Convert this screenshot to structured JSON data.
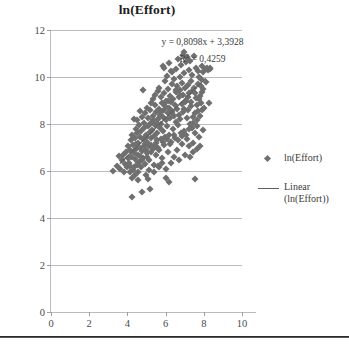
{
  "chart_data": {
    "type": "scatter",
    "title": "ln(Effort)",
    "xlabel": "",
    "ylabel": "",
    "xlim": [
      0,
      10
    ],
    "ylim": [
      0,
      12
    ],
    "xticks": [
      0,
      2,
      4,
      6,
      8,
      10
    ],
    "yticks": [
      0,
      2,
      4,
      6,
      8,
      10,
      12
    ],
    "xtick_labels": [
      "0",
      "2",
      "4",
      "6",
      "8",
      "10"
    ],
    "ytick_labels": [
      "0",
      "2",
      "4",
      "6",
      "8",
      "10",
      "12"
    ],
    "grid": "horizontal",
    "legend_position": "right",
    "marker_color": "#6f6f6f",
    "trendline_color": "#5f5f5f",
    "gridline_color": "#b9bcc0",
    "annotations": {
      "equation": "y = 0,8098x + 3,3928",
      "r_squared_prefix": "R",
      "r_squared_exponent": "2",
      "r_squared_value": " = 0,4259"
    },
    "trendline": {
      "slope": 0.8098,
      "intercept": 3.3928,
      "r_squared": 0.4259,
      "x_start": 3.6,
      "x_end": 8.1
    },
    "legend": [
      {
        "label": "ln(Effort)",
        "key": "diamond-marker"
      },
      {
        "label": "Linear (ln(Effort))",
        "key": "line-marker"
      }
    ],
    "points": [
      [
        3.22,
        6.02
      ],
      [
        3.45,
        6.22
      ],
      [
        3.55,
        6.62
      ],
      [
        3.62,
        6.1
      ],
      [
        3.7,
        6.45
      ],
      [
        3.78,
        6.68
      ],
      [
        3.82,
        5.95
      ],
      [
        3.88,
        6.3
      ],
      [
        3.92,
        6.8
      ],
      [
        3.96,
        6.15
      ],
      [
        4.02,
        6.55
      ],
      [
        4.05,
        7.05
      ],
      [
        4.08,
        6.35
      ],
      [
        4.12,
        6.9
      ],
      [
        4.15,
        6.2
      ],
      [
        4.18,
        7.3
      ],
      [
        4.2,
        6.6
      ],
      [
        4.22,
        5.7
      ],
      [
        4.24,
        4.9
      ],
      [
        4.26,
        7.55
      ],
      [
        4.28,
        6.05
      ],
      [
        4.3,
        7.1
      ],
      [
        4.32,
        6.75
      ],
      [
        4.35,
        8.2
      ],
      [
        4.38,
        7.4
      ],
      [
        4.4,
        6.5
      ],
      [
        4.42,
        5.85
      ],
      [
        4.44,
        7.8
      ],
      [
        4.46,
        6.95
      ],
      [
        4.48,
        7.6
      ],
      [
        4.5,
        6.25
      ],
      [
        4.52,
        8.15
      ],
      [
        4.54,
        7.2
      ],
      [
        4.56,
        6.7
      ],
      [
        4.58,
        5.6
      ],
      [
        4.6,
        7.95
      ],
      [
        4.62,
        6.4
      ],
      [
        4.64,
        7.45
      ],
      [
        4.66,
        8.55
      ],
      [
        4.68,
        7.0
      ],
      [
        4.7,
        6.15
      ],
      [
        4.72,
        7.7
      ],
      [
        4.74,
        5.1
      ],
      [
        4.76,
        8.3
      ],
      [
        4.78,
        6.85
      ],
      [
        4.8,
        7.35
      ],
      [
        4.82,
        9.45
      ],
      [
        4.84,
        6.55
      ],
      [
        4.86,
        7.85
      ],
      [
        4.88,
        8.05
      ],
      [
        4.9,
        7.15
      ],
      [
        4.92,
        6.3
      ],
      [
        4.94,
        8.45
      ],
      [
        4.96,
        7.55
      ],
      [
        4.98,
        6.9
      ],
      [
        5.0,
        7.25
      ],
      [
        5.02,
        8.7
      ],
      [
        5.04,
        6.6
      ],
      [
        5.06,
        7.9
      ],
      [
        5.08,
        5.65
      ],
      [
        5.1,
        8.25
      ],
      [
        5.12,
        7.05
      ],
      [
        5.14,
        6.45
      ],
      [
        5.16,
        8.6
      ],
      [
        5.18,
        7.65
      ],
      [
        5.2,
        5.25
      ],
      [
        5.22,
        8.9
      ],
      [
        5.24,
        7.4
      ],
      [
        5.26,
        6.8
      ],
      [
        5.28,
        8.1
      ],
      [
        5.3,
        7.75
      ],
      [
        5.32,
        9.05
      ],
      [
        5.34,
        6.95
      ],
      [
        5.36,
        8.35
      ],
      [
        5.38,
        7.5
      ],
      [
        5.4,
        6.25
      ],
      [
        5.42,
        8.8
      ],
      [
        5.44,
        7.95
      ],
      [
        5.46,
        9.25
      ],
      [
        5.48,
        7.2
      ],
      [
        5.5,
        8.5
      ],
      [
        5.52,
        6.7
      ],
      [
        5.54,
        8.05
      ],
      [
        5.56,
        7.6
      ],
      [
        5.58,
        9.4
      ],
      [
        5.6,
        8.2
      ],
      [
        5.62,
        7.0
      ],
      [
        5.64,
        8.65
      ],
      [
        5.66,
        6.15
      ],
      [
        5.68,
        9.55
      ],
      [
        5.7,
        7.85
      ],
      [
        5.72,
        8.4
      ],
      [
        5.74,
        7.35
      ],
      [
        5.76,
        9.15
      ],
      [
        5.78,
        8.0
      ],
      [
        5.8,
        6.55
      ],
      [
        5.82,
        8.9
      ],
      [
        5.84,
        7.7
      ],
      [
        5.86,
        10.45
      ],
      [
        5.88,
        8.3
      ],
      [
        5.9,
        7.1
      ],
      [
        5.92,
        9.3
      ],
      [
        5.94,
        8.6
      ],
      [
        5.96,
        7.45
      ],
      [
        5.98,
        9.85
      ],
      [
        6.0,
        8.15
      ],
      [
        6.02,
        5.7
      ],
      [
        6.04,
        9.0
      ],
      [
        6.06,
        7.9
      ],
      [
        6.08,
        10.05
      ],
      [
        6.1,
        8.45
      ],
      [
        6.12,
        6.8
      ],
      [
        6.14,
        9.5
      ],
      [
        6.16,
        8.7
      ],
      [
        6.18,
        7.55
      ],
      [
        6.2,
        10.6
      ],
      [
        6.22,
        8.25
      ],
      [
        6.24,
        9.2
      ],
      [
        6.26,
        7.25
      ],
      [
        6.28,
        8.95
      ],
      [
        6.3,
        6.35
      ],
      [
        6.32,
        9.7
      ],
      [
        6.34,
        8.55
      ],
      [
        6.36,
        10.2
      ],
      [
        6.38,
        7.8
      ],
      [
        6.4,
        9.05
      ],
      [
        6.42,
        8.35
      ],
      [
        6.44,
        6.6
      ],
      [
        6.46,
        9.9
      ],
      [
        6.48,
        8.8
      ],
      [
        6.5,
        7.4
      ],
      [
        6.52,
        10.35
      ],
      [
        6.54,
        9.35
      ],
      [
        6.56,
        8.1
      ],
      [
        6.58,
        6.9
      ],
      [
        6.6,
        9.6
      ],
      [
        6.62,
        8.65
      ],
      [
        6.64,
        10.75
      ],
      [
        6.66,
        7.95
      ],
      [
        6.68,
        9.15
      ],
      [
        6.7,
        8.4
      ],
      [
        6.72,
        6.45
      ],
      [
        6.74,
        10.0
      ],
      [
        6.76,
        9.45
      ],
      [
        6.78,
        8.2
      ],
      [
        6.8,
        7.6
      ],
      [
        6.82,
        10.5
      ],
      [
        6.84,
        9.75
      ],
      [
        6.86,
        8.85
      ],
      [
        6.88,
        7.15
      ],
      [
        6.9,
        9.25
      ],
      [
        6.92,
        8.5
      ],
      [
        6.94,
        11.05
      ],
      [
        6.96,
        10.15
      ],
      [
        6.98,
        7.7
      ],
      [
        7.0,
        9.55
      ],
      [
        7.02,
        8.95
      ],
      [
        7.04,
        6.7
      ],
      [
        7.06,
        10.65
      ],
      [
        7.08,
        9.0
      ],
      [
        7.1,
        8.25
      ],
      [
        7.12,
        7.35
      ],
      [
        7.14,
        10.85
      ],
      [
        7.16,
        9.65
      ],
      [
        7.18,
        8.6
      ],
      [
        7.2,
        7.05
      ],
      [
        7.22,
        10.3
      ],
      [
        7.24,
        9.3
      ],
      [
        7.26,
        8.0
      ],
      [
        7.28,
        6.6
      ],
      [
        7.3,
        10.7
      ],
      [
        7.32,
        9.85
      ],
      [
        7.34,
        8.75
      ],
      [
        7.36,
        7.85
      ],
      [
        7.38,
        10.1
      ],
      [
        7.4,
        9.4
      ],
      [
        7.42,
        8.3
      ],
      [
        7.44,
        7.2
      ],
      [
        7.46,
        6.8
      ],
      [
        7.48,
        10.9
      ],
      [
        7.5,
        9.55
      ],
      [
        7.52,
        8.45
      ],
      [
        7.54,
        7.6
      ],
      [
        7.56,
        5.65
      ],
      [
        7.58,
        10.4
      ],
      [
        7.6,
        9.1
      ],
      [
        7.62,
        8.15
      ],
      [
        7.64,
        7.9
      ],
      [
        7.66,
        6.95
      ],
      [
        7.68,
        10.25
      ],
      [
        7.7,
        9.7
      ],
      [
        7.72,
        8.55
      ],
      [
        7.74,
        7.45
      ],
      [
        7.76,
        10.0
      ],
      [
        7.78,
        9.2
      ],
      [
        7.8,
        8.35
      ],
      [
        7.82,
        7.05
      ],
      [
        7.84,
        9.9
      ],
      [
        7.86,
        8.9
      ],
      [
        7.88,
        10.45
      ],
      [
        7.9,
        9.35
      ],
      [
        7.92,
        8.6
      ],
      [
        7.94,
        7.75
      ],
      [
        7.96,
        10.2
      ],
      [
        7.98,
        9.5
      ],
      [
        8.0,
        8.7
      ],
      [
        8.05,
        10.35
      ],
      [
        8.1,
        9.8
      ],
      [
        8.15,
        10.4
      ],
      [
        8.2,
        10.3
      ],
      [
        8.25,
        8.9
      ],
      [
        8.35,
        10.4
      ],
      [
        4.95,
        7.45
      ],
      [
        5.15,
        7.95
      ],
      [
        5.35,
        8.15
      ],
      [
        5.55,
        7.3
      ],
      [
        5.75,
        8.5
      ],
      [
        5.95,
        8.75
      ],
      [
        6.15,
        9.0
      ],
      [
        6.35,
        8.45
      ],
      [
        6.55,
        9.45
      ],
      [
        6.75,
        9.25
      ],
      [
        6.95,
        8.65
      ],
      [
        7.15,
        9.15
      ],
      [
        7.35,
        8.95
      ],
      [
        7.55,
        9.3
      ],
      [
        7.75,
        9.05
      ],
      [
        4.45,
        7.15
      ],
      [
        4.65,
        6.65
      ],
      [
        4.85,
        7.05
      ],
      [
        4.55,
        6.35
      ],
      [
        4.75,
        6.45
      ],
      [
        5.05,
        6.75
      ],
      [
        5.25,
        7.1
      ],
      [
        5.45,
        7.05
      ],
      [
        5.65,
        6.9
      ],
      [
        5.85,
        7.25
      ],
      [
        6.05,
        7.35
      ],
      [
        6.25,
        7.15
      ],
      [
        6.45,
        7.55
      ],
      [
        6.65,
        7.3
      ],
      [
        6.85,
        7.5
      ],
      [
        4.35,
        6.15
      ],
      [
        4.15,
        5.95
      ],
      [
        4.55,
        5.95
      ],
      [
        4.95,
        5.85
      ],
      [
        5.15,
        6.05
      ],
      [
        6.2,
        5.55
      ],
      [
        6.0,
        6.1
      ],
      [
        5.8,
        6.35
      ],
      [
        5.6,
        6.2
      ],
      [
        5.4,
        5.95
      ],
      [
        7.05,
        7.55
      ],
      [
        7.25,
        7.8
      ],
      [
        7.45,
        8.05
      ],
      [
        7.65,
        8.8
      ],
      [
        7.85,
        9.6
      ],
      [
        6.9,
        10.95
      ],
      [
        7.1,
        10.8
      ],
      [
        6.3,
        10.25
      ],
      [
        5.9,
        10.4
      ],
      [
        8.3,
        10.35
      ]
    ]
  }
}
